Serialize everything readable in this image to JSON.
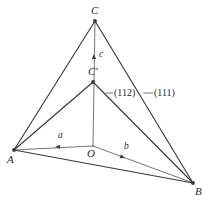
{
  "figure": {
    "background_color": "#ffffff",
    "line_color": "#3a3a3a",
    "text_color": "#2b2b2b"
  },
  "vertices": [
    {
      "id": "C",
      "label": "C",
      "x": 95,
      "y": 21,
      "label_x": 91,
      "label_y": 5
    },
    {
      "id": "Cprime",
      "label": "C'",
      "x": 93,
      "y": 82,
      "label_x": 88,
      "label_y": 66
    },
    {
      "id": "A",
      "label": "A",
      "x": 14,
      "y": 150,
      "label_x": 7,
      "label_y": 154
    },
    {
      "id": "B",
      "label": "B",
      "x": 193,
      "y": 183,
      "label_x": 195,
      "label_y": 186
    },
    {
      "id": "O",
      "label": "O",
      "x": 93,
      "y": 146,
      "label_x": 87,
      "label_y": 148
    }
  ],
  "edges": [
    {
      "name": "edge-A-C",
      "from": "A",
      "to": "C"
    },
    {
      "name": "edge-C-B",
      "from": "C",
      "to": "B"
    },
    {
      "name": "edge-A-Cprime",
      "from": "A",
      "to": "Cprime"
    },
    {
      "name": "edge-Cprime-B",
      "from": "Cprime",
      "to": "B"
    },
    {
      "name": "edge-A-B",
      "from": "A",
      "to": "B"
    },
    {
      "name": "edge-O-C",
      "from": "O",
      "to": "C"
    },
    {
      "name": "edge-A-O",
      "from": "A",
      "to": "O"
    },
    {
      "name": "edge-O-B",
      "from": "O",
      "to": "B"
    }
  ],
  "vectors": [
    {
      "id": "a",
      "label": "a",
      "from": "O",
      "to": "A",
      "arrow_x": 55,
      "arrow_y": 147,
      "label_x": 58,
      "label_y": 131
    },
    {
      "id": "b",
      "label": "b",
      "from": "O",
      "to": "B",
      "arrow_x": 125,
      "arrow_y": 158,
      "label_x": 124,
      "label_y": 142
    },
    {
      "id": "c",
      "label": "c",
      "from": "O",
      "to": "C",
      "arrow_x": 94,
      "arrow_y": 54,
      "label_x": 99,
      "label_y": 50
    }
  ],
  "plane_labels": [
    {
      "id": "label-112",
      "text": "(112)",
      "label_x": 114,
      "label_y": 88,
      "leader_from_x": 113,
      "leader_from_y": 93,
      "leader_to_x": 106,
      "leader_to_y": 93
    },
    {
      "id": "label-111",
      "text": "(111)",
      "label_x": 154,
      "label_y": 88,
      "leader_from_x": 153,
      "leader_from_y": 93,
      "leader_to_x": 144,
      "leader_to_y": 93
    }
  ]
}
